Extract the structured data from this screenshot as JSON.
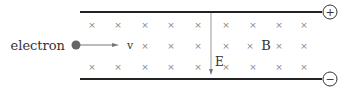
{
  "diagram": {
    "particle_label": "electron",
    "velocity_label": "v",
    "electric_field_label": "E",
    "magnetic_field_label": "B",
    "positive_terminal": "+",
    "negative_terminal": "−",
    "field_symbol": "×",
    "colors": {
      "plates": "#222222",
      "crosses": "#888888",
      "electron": "#666666",
      "arrows": "#777777"
    }
  }
}
